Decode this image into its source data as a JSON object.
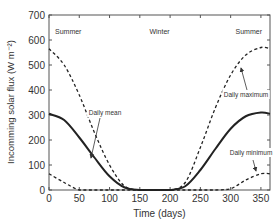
{
  "chart_data": {
    "type": "line",
    "title": "",
    "xlabel": "Time (days)",
    "ylabel": "Incomming solar flux (W m⁻²)",
    "xlim": [
      0,
      365
    ],
    "ylim": [
      0,
      700
    ],
    "xticks": [
      0,
      50,
      100,
      150,
      200,
      250,
      300,
      350
    ],
    "yticks": [
      0,
      100,
      200,
      300,
      400,
      500,
      600,
      700
    ],
    "grid": false,
    "legend": "none (inline annotations)",
    "values_note": "Day-0 endpoints and near-zero plateau are read from the image; intermediate points are estimated from curve shape, not labeled in the source.",
    "season_labels": [
      {
        "text": "Summer",
        "x": 0
      },
      {
        "text": "Winter",
        "x": 182
      },
      {
        "text": "Summer",
        "x": 365
      }
    ],
    "annotations": [
      {
        "text": "Daily mean",
        "points_to_series": "Daily mean"
      },
      {
        "text": "Daily maximum",
        "points_to_series": "Daily maximum"
      },
      {
        "text": "Daily minimum",
        "points_to_series": "Daily minimum"
      }
    ],
    "x": [
      0,
      25,
      50,
      75,
      100,
      125,
      150,
      175,
      200,
      225,
      250,
      275,
      300,
      325,
      350,
      365
    ],
    "series": [
      {
        "name": "Daily maximum",
        "style": "dashed",
        "values": [
          565,
          500,
          380,
          230,
          100,
          15,
          0,
          0,
          0,
          30,
          170,
          330,
          460,
          540,
          570,
          565
        ]
      },
      {
        "name": "Daily mean",
        "style": "solid",
        "values": [
          305,
          280,
          210,
          130,
          55,
          10,
          0,
          0,
          0,
          15,
          80,
          165,
          245,
          295,
          310,
          305
        ]
      },
      {
        "name": "Daily minimum",
        "style": "dashed",
        "values": [
          65,
          30,
          0,
          0,
          0,
          0,
          0,
          0,
          0,
          0,
          0,
          0,
          5,
          40,
          65,
          65
        ]
      }
    ]
  }
}
